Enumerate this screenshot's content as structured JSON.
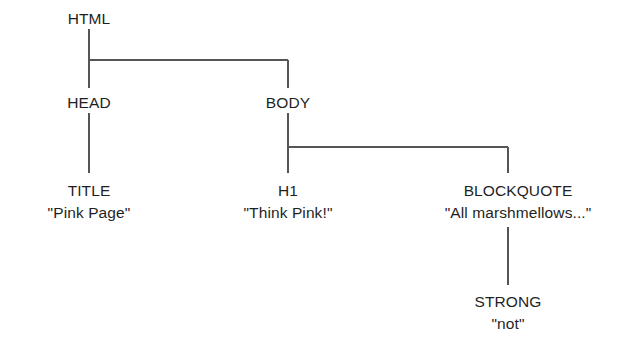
{
  "diagram": {
    "type": "dom-tree",
    "background_color": "#ffffff",
    "line_color": "#555555",
    "text_color": "#1f1f1f",
    "nodes": [
      {
        "id": "html",
        "tag": "HTML",
        "text": "",
        "x": 89,
        "y": 8,
        "parent": null
      },
      {
        "id": "head",
        "tag": "HEAD",
        "text": "",
        "x": 89,
        "y": 92,
        "parent": "html"
      },
      {
        "id": "body",
        "tag": "BODY",
        "text": "",
        "x": 288,
        "y": 92,
        "parent": "html"
      },
      {
        "id": "title",
        "tag": "TITLE",
        "text": "\"Pink Page\"",
        "x": 89,
        "y": 180,
        "parent": "head"
      },
      {
        "id": "h1",
        "tag": "H1",
        "text": "\"Think Pink!\"",
        "x": 288,
        "y": 180,
        "parent": "body"
      },
      {
        "id": "blockquote",
        "tag": "BLOCKQUOTE",
        "text": "\"All marshmellows...\"",
        "x": 518,
        "y": 180,
        "parent": "body"
      },
      {
        "id": "strong",
        "tag": "STRONG",
        "text": "\"not\"",
        "x": 508,
        "y": 291,
        "parent": "blockquote"
      }
    ]
  }
}
